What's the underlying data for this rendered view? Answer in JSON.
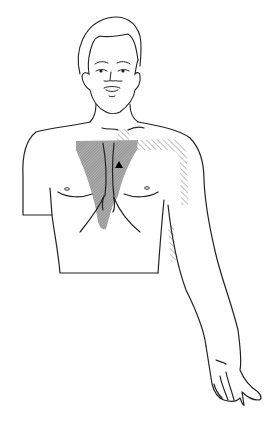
{
  "figure": {
    "regions": [
      {
        "id": "primary-pain-area",
        "description": "central chest / sternum region, dense gray shading",
        "fill": "#9e9e9e"
      },
      {
        "id": "radiating-pain-area",
        "description": "left shoulder and inner left arm, light diagonal hatching",
        "fill": "#bdbdbd"
      },
      {
        "id": "marker",
        "description": "black triangle marker on upper left chest",
        "fill": "#000000"
      }
    ],
    "colors": {
      "line": "#222222",
      "background": "#ffffff",
      "dense_shade": "#9e9e9e",
      "hatch": "#9a9a9a"
    }
  }
}
